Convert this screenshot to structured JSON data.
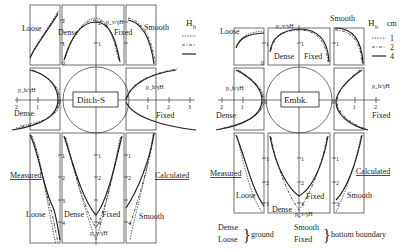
{
  "figure": {
    "panels": [
      {
        "id": "ditch",
        "label": "Ditch-S",
        "top": {
          "labels": [
            "Loose",
            "Dense",
            "Fixed",
            "Smooth"
          ],
          "axis_label": "p_v/γH",
          "ticks": [
            "0",
            "1",
            "2"
          ]
        },
        "left": {
          "labels": [
            "Dense"
          ],
          "axis_label": "p_h/γH",
          "ticks": [
            "2",
            "1",
            "0"
          ]
        },
        "right": {
          "labels": [
            "Fixed"
          ],
          "axis_label": "p_h/γH",
          "ticks": [
            "0",
            "1",
            "2",
            "3"
          ]
        },
        "bottom": {
          "labels": [
            "Loose",
            "Dense",
            "Fixed",
            "Smooth"
          ],
          "axis_label": "p_v/γH",
          "ticks": [
            "0",
            "1",
            "2",
            "3",
            "4"
          ]
        },
        "measured_label": "Measured",
        "calculated_label": "Calculated"
      },
      {
        "id": "embk",
        "label": "Embk.",
        "top": {
          "labels": [
            "Loose",
            "Dense",
            "Fixed",
            "Smooth"
          ],
          "axis_label": "p_v/γH",
          "ticks": [
            "0",
            "1"
          ]
        },
        "left": {
          "labels": [
            "Dense"
          ],
          "axis_label": "p_h/γH",
          "ticks": [
            "2",
            "1",
            "0"
          ]
        },
        "right": {
          "labels": [
            "Fixed"
          ],
          "axis_label": "p_h/γH",
          "ticks": [
            "0",
            "1",
            "2"
          ]
        },
        "bottom": {
          "labels": [
            "Loose",
            "Dense",
            "Fixed",
            "Smooth"
          ],
          "axis_label": "p_v/γH",
          "ticks": [
            "0",
            "1",
            "2",
            "3"
          ]
        },
        "measured_label": "Measured",
        "calculated_label": "Calculated"
      }
    ],
    "legend": {
      "title": "H_b  cm",
      "title_main": "H",
      "title_sub": "b",
      "unit": "cm",
      "entries": [
        {
          "style": "dotted",
          "value": "1"
        },
        {
          "style": "dash-dot",
          "value": "2"
        },
        {
          "style": "solid",
          "value": "4"
        }
      ]
    },
    "key": {
      "ground_items": [
        "Dense",
        "Loose"
      ],
      "ground_label": "ground",
      "boundary_items": [
        "Smooth",
        "Fixed"
      ],
      "boundary_label": "bottom boundary"
    }
  }
}
